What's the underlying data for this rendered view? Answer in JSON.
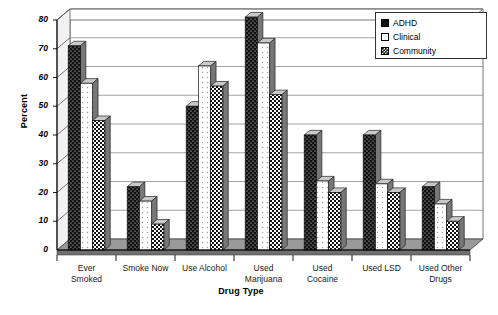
{
  "chart_data": {
    "type": "bar",
    "title": "",
    "xlabel": "Drug Type",
    "ylabel": "Percent",
    "ylim": [
      0,
      80
    ],
    "ytick_step": 10,
    "yticks": [
      0,
      10,
      20,
      30,
      40,
      50,
      60,
      70,
      80
    ],
    "grid": true,
    "legend_position": "top-right",
    "style_3d": true,
    "categories": [
      "Ever Smoked",
      "Smoke Now",
      "Use Alcohol",
      "Used Marijuana",
      "Used Cocaine",
      "Used LSD",
      "Used Other Drugs"
    ],
    "series": [
      {
        "name": "ADHD",
        "swatch": "solid-black",
        "color": "#111111",
        "values": [
          71,
          22,
          50,
          81,
          40,
          40,
          22
        ]
      },
      {
        "name": "Clinical",
        "swatch": "white",
        "color": "#ffffff",
        "values": [
          58,
          17,
          64,
          72,
          24,
          23,
          16
        ]
      },
      {
        "name": "Community",
        "swatch": "checkered",
        "color": "#111111",
        "values": [
          45,
          9,
          57,
          54,
          20,
          20,
          10
        ]
      }
    ]
  },
  "legend": {
    "items": [
      {
        "label": "ADHD"
      },
      {
        "label": "Clinical"
      },
      {
        "label": "Community"
      }
    ]
  },
  "axes": {
    "y_title": "Percent",
    "x_title": "Drug Type"
  },
  "colors": {
    "background": "#ffffff",
    "axis": "#000000",
    "gridline": "#8c8c8c",
    "floor": "#9a9a9a",
    "bar_dark": "#111111",
    "bar_light": "#ffffff",
    "bar_side": "#777777",
    "bar_top": "#c9c9c9"
  }
}
